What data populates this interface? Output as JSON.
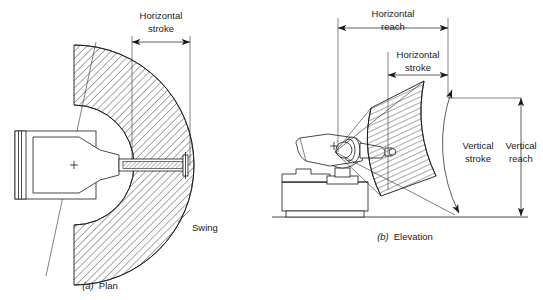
{
  "figure": {
    "background_color": "#ffffff",
    "line_color": "#1a1a1a",
    "width": 543,
    "height": 300
  },
  "plan": {
    "caption_marker": "(a)",
    "caption_text": "Plan",
    "labels": {
      "horizontal_stroke_line1": "Horizontal",
      "horizontal_stroke_line2": "stroke",
      "swing": "Swing"
    }
  },
  "elevation": {
    "caption_marker": "(b)",
    "caption_text": "Elevation",
    "labels": {
      "horizontal_reach_line1": "Horizontal",
      "horizontal_reach_line2": "reach",
      "horizontal_stroke_line1": "Horizontal",
      "horizontal_stroke_line2": "stroke",
      "vertical_stroke_line1": "Vertical",
      "vertical_stroke_line2": "stroke",
      "vertical_reach_line1": "Vertical",
      "vertical_reach_line2": "reach"
    }
  }
}
